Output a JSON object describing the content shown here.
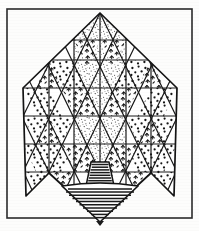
{
  "figure": {
    "medium": "line drawing",
    "background_color": "#fdfdfc",
    "ink_color": "#1a1a1a",
    "frame": {
      "name": "border-frame",
      "color": "#2b2b2b",
      "x": 7,
      "y": 9,
      "width": 185,
      "height": 209,
      "stroke_width": 1.6
    },
    "canopy": {
      "name": "triangular-lattice-canopy",
      "apex": {
        "x": 100,
        "y": 13
      },
      "left_extreme": {
        "x": 23,
        "y": 88
      },
      "right_extreme": {
        "x": 177,
        "y": 88
      },
      "left_bottom_point": {
        "x": 26,
        "y": 196
      },
      "right_bottom_point": {
        "x": 174,
        "y": 196
      },
      "cell_width": 25.6,
      "cell_height": 28.0,
      "outline_stroke": 1.7,
      "grid_stroke": 1.2,
      "fill_patterns": [
        "fine-stipple",
        "round-dots",
        "chevron-marks",
        "blank"
      ]
    },
    "base": {
      "name": "spinning-top-base",
      "neck": {
        "name": "hatched-neck",
        "top_y": 162,
        "bottom_y": 186,
        "top_half_width": 9,
        "bottom_half_width": 14,
        "center_x": 100,
        "hatch_line_count": 9
      },
      "cone": {
        "name": "hatched-inverted-cone",
        "top_y": 186,
        "tip_y": 222,
        "half_width": 38,
        "center_x": 100,
        "hatch_line_count": 9
      },
      "hatch_color": "#1a1a1a",
      "hatch_stroke": 1.5
    },
    "patterns": {
      "fine_stipple": {
        "name": "fine-stipple-pattern",
        "dot_radius": 0.55,
        "density": "high"
      },
      "round_dots": {
        "name": "round-dot-pattern",
        "dot_radius": 1.15,
        "density": "medium"
      },
      "chevron_marks": {
        "name": "chevron-mark-pattern",
        "glyph": "bird-chevron",
        "density": "medium"
      }
    }
  }
}
